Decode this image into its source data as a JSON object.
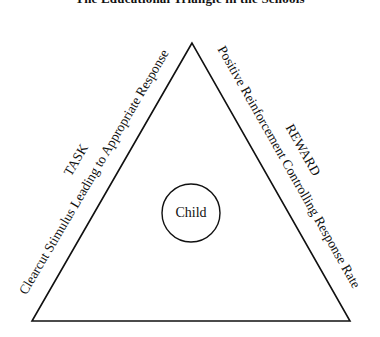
{
  "title": "The Educational Triangle in the Schools",
  "diagram": {
    "shape": "triangle",
    "vertices": {
      "apex": [
        192,
        43
      ],
      "bottom_left": [
        32,
        321
      ],
      "bottom_right": [
        350,
        321
      ]
    },
    "center_circle": {
      "label": "Child",
      "cx": 191,
      "cy": 213,
      "r": 29
    },
    "left_side": {
      "heading": "TASK",
      "description": "Clearcut Stimulus Leading to Appropriate Response"
    },
    "right_side": {
      "heading": "REWARD",
      "description": "Positive Reinforcement Controlling Response Rate"
    },
    "line_color": "#111111"
  }
}
